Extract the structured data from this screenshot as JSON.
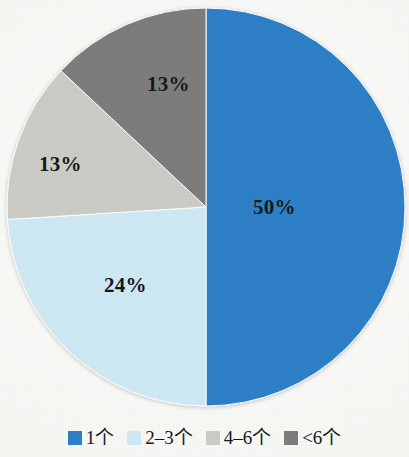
{
  "chart_data": {
    "type": "pie",
    "title": "",
    "subtitle": "",
    "xlabel": "",
    "ylabel": "",
    "legend_position": "bottom",
    "grid": false,
    "categories": [
      "1个",
      "2–3个",
      "4–6个",
      "<6个"
    ],
    "values": [
      50,
      24,
      13,
      13
    ],
    "labels": [
      "50%",
      "24%",
      "13%",
      "13%"
    ],
    "colors": [
      "#2e81c8",
      "#cfe9f5",
      "#cdcdc8",
      "#7d7d7d"
    ],
    "slices": [
      {
        "category": "1个",
        "label": "50%",
        "value": 50,
        "color": "#2e81c8",
        "start_deg": 0,
        "end_deg": 180
      },
      {
        "category": "2–3个",
        "label": "24%",
        "value": 24,
        "color": "#cfe9f5",
        "start_deg": 180,
        "end_deg": 266.4
      },
      {
        "category": "4–6个",
        "label": "13%",
        "value": 13,
        "color": "#cdcdc8",
        "start_deg": 266.4,
        "end_deg": 313.2
      },
      {
        "category": "<6个",
        "label": "13%",
        "value": 13,
        "color": "#7d7d7d",
        "start_deg": 313.2,
        "end_deg": 360
      }
    ]
  },
  "legend": {
    "items": [
      {
        "label": "1个",
        "color": "#2e81c8"
      },
      {
        "label": "2–3个",
        "color": "#cfe9f5"
      },
      {
        "label": "4–6个",
        "color": "#cdcdc8"
      },
      {
        "label": "<6个",
        "color": "#7d7d7d"
      }
    ]
  },
  "labels": {
    "blue": "50%",
    "light_blue": "24%",
    "light_gray": "13%",
    "dark_gray": "13%"
  }
}
